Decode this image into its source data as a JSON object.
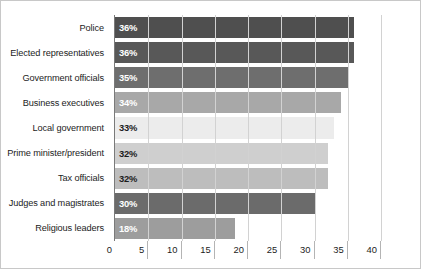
{
  "chart_data": {
    "type": "bar",
    "orientation": "horizontal",
    "title": "",
    "xlabel": "",
    "ylabel": "",
    "xlim": [
      0,
      43
    ],
    "grid": true,
    "legend": "none",
    "xticks": [
      0,
      5,
      10,
      15,
      20,
      25,
      30,
      35,
      40
    ],
    "xtick_labels": [
      "0",
      "5",
      "10",
      "15",
      "20",
      "25",
      "30",
      "35",
      "40"
    ],
    "categories": [
      "Police",
      "Elected representatives",
      "Government officials",
      "Business executives",
      "Local government",
      "Prime minister/president",
      "Tax officials",
      "Judges and magistrates",
      "Religious leaders"
    ],
    "values": [
      36,
      36,
      35,
      34,
      33,
      32,
      32,
      30,
      18
    ],
    "data_labels": [
      "36%",
      "36%",
      "35%",
      "34%",
      "33%",
      "32%",
      "32%",
      "30%",
      "18%"
    ],
    "bar_colors": [
      "#4f4f4f",
      "#585858",
      "#6e6e6e",
      "#a8a8a8",
      "#ececec",
      "#cfcfcf",
      "#bdbdbd",
      "#6b6b6b",
      "#9d9d9d"
    ],
    "label_text_colors": [
      "#ffffff",
      "#ffffff",
      "#ffffff",
      "#ffffff",
      "#1c1c1c",
      "#1c1c1c",
      "#1c1c1c",
      "#ffffff",
      "#ffffff"
    ]
  },
  "axis": {
    "origin_label": "0"
  }
}
